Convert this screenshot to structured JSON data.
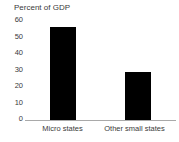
{
  "chart_data": {
    "type": "bar",
    "title": "Percent of GDP",
    "xlabel": "",
    "ylabel": "",
    "categories": [
      "Micro states",
      "Other small states"
    ],
    "values": [
      54.5,
      28.5
    ],
    "yticks": [
      "0",
      "10",
      "20",
      "30",
      "40",
      "50",
      "60"
    ],
    "ylim": [
      0,
      60
    ],
    "grid": false,
    "legend": false,
    "legend_position": "none",
    "bar_color": "#000000",
    "axis_color": "#a9a9a9",
    "text_color": "#3a3a3a",
    "background_color": "#ffffff"
  },
  "axis": {
    "y_tick_0": "0",
    "y_tick_1": "10",
    "y_tick_2": "20",
    "y_tick_3": "30",
    "y_tick_4": "40",
    "y_tick_5": "50",
    "y_tick_6": "60"
  },
  "categories": {
    "cat_0": "Micro states",
    "cat_1": "Other small states"
  }
}
